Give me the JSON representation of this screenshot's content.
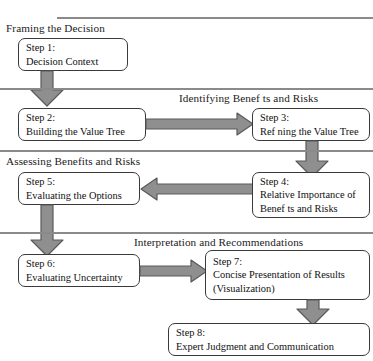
{
  "diagram": {
    "colors": {
      "rule": "#8a8a8a",
      "box_border": "#3a3a3a",
      "arrow_fill": "#8f8f8f",
      "arrow_stroke": "#5a5a5a",
      "text": "#111111",
      "background": "#ffffff"
    }
  },
  "phases": [
    {
      "label": "Framing the Decision"
    },
    {
      "label": "Identifying Benef ts and Risks"
    },
    {
      "label": "Assessing Benefits and Risks"
    },
    {
      "label": "Interpretation and Recommendations"
    }
  ],
  "steps": [
    {
      "id": "step-1",
      "title": "Step 1:",
      "line2": "Decision Context",
      "line3": ""
    },
    {
      "id": "step-2",
      "title": "Step 2:",
      "line2": "Building the Value Tree",
      "line3": ""
    },
    {
      "id": "step-3",
      "title": "Step 3:",
      "line2": "Ref ning the Value Tree",
      "line3": ""
    },
    {
      "id": "step-4",
      "title": "Step 4:",
      "line2": "Relative Importance of",
      "line3": "Benef ts and Risks"
    },
    {
      "id": "step-5",
      "title": "Step 5:",
      "line2": "Evaluating the Options",
      "line3": ""
    },
    {
      "id": "step-6",
      "title": "Step 6:",
      "line2": "Evaluating Uncertainty",
      "line3": ""
    },
    {
      "id": "step-7",
      "title": "Step 7:",
      "line2": "Concise Presentation of Results",
      "line3": "(Visualization)"
    },
    {
      "id": "step-8",
      "title": "Step 8:",
      "line2": "Expert Judgment and Communication",
      "line3": ""
    }
  ],
  "connections": [
    {
      "id": "arrow-step1-step2",
      "from": "step-1",
      "to": "step-2",
      "direction": "down"
    },
    {
      "id": "arrow-step2-step3",
      "from": "step-2",
      "to": "step-3",
      "direction": "right"
    },
    {
      "id": "arrow-step3-step4",
      "from": "step-3",
      "to": "step-4",
      "direction": "down"
    },
    {
      "id": "arrow-step4-step5",
      "from": "step-4",
      "to": "step-5",
      "direction": "left"
    },
    {
      "id": "arrow-step5-step6",
      "from": "step-5",
      "to": "step-6",
      "direction": "down"
    },
    {
      "id": "arrow-step6-step7",
      "from": "step-6",
      "to": "step-7",
      "direction": "right"
    },
    {
      "id": "arrow-step7-step8",
      "from": "step-7",
      "to": "step-8",
      "direction": "down"
    }
  ]
}
